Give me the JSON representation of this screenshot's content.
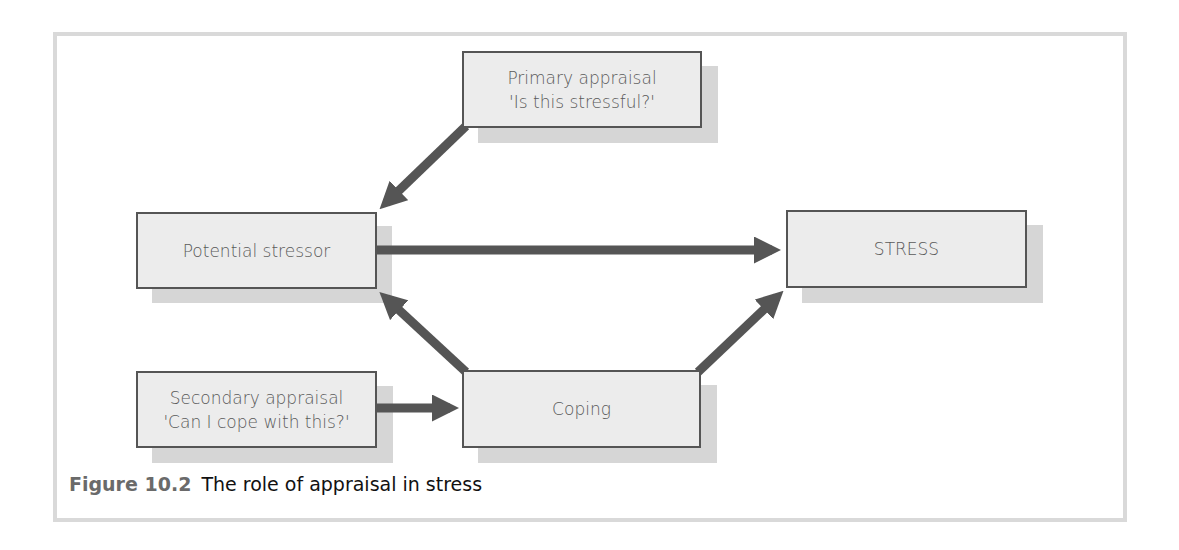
{
  "figure": {
    "number": "Figure 10.2",
    "title": "The role of appraisal in stress"
  },
  "nodes": {
    "primary": {
      "line1": "Primary appraisal",
      "line2": "'Is this stressful?'"
    },
    "stressor": {
      "label": "Potential stressor"
    },
    "stress": {
      "label": "STRESS"
    },
    "secondary": {
      "line1": "Secondary appraisal",
      "line2": "'Can I cope with this?'"
    },
    "coping": {
      "label": "Coping"
    }
  },
  "edges": [
    {
      "from": "primary",
      "to": "stressor"
    },
    {
      "from": "stressor",
      "to": "stress"
    },
    {
      "from": "coping",
      "to": "stressor"
    },
    {
      "from": "coping",
      "to": "stress"
    },
    {
      "from": "secondary",
      "to": "coping"
    }
  ],
  "colors": {
    "arrow": "#555555",
    "box_fill": "#ececec",
    "box_border": "#555555",
    "shadow": "#d6d6d6",
    "frame": "#d9d9d9"
  }
}
